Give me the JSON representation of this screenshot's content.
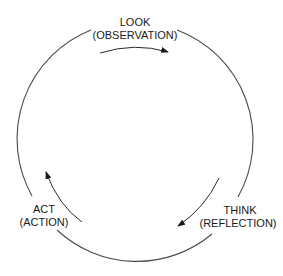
{
  "diagram": {
    "type": "cycle",
    "nodes": [
      {
        "id": "look",
        "title": "LOOK",
        "subtitle": "(OBSERVATION)"
      },
      {
        "id": "think",
        "title": "THINK",
        "subtitle": "(REFLECTION)"
      },
      {
        "id": "act",
        "title": "ACT",
        "subtitle": "(ACTION)"
      }
    ],
    "edges": [
      {
        "from": "look",
        "to": "think",
        "direction": "clockwise"
      },
      {
        "from": "think",
        "to": "act",
        "direction": "clockwise"
      },
      {
        "from": "act",
        "to": "look",
        "direction": "clockwise"
      }
    ],
    "colors": {
      "line": "#4a4a4a",
      "text": "#1a1a1a",
      "background": "#ffffff"
    }
  }
}
